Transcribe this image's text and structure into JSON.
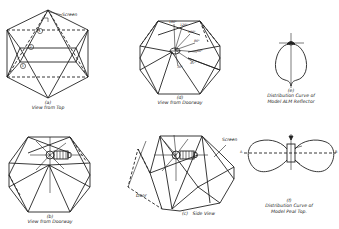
{
  "header": {
    "cropped_text_line": "(text line cut off at top edge)"
  },
  "figures": [
    {
      "id": "a",
      "label": "(a)",
      "caption": "View from Top",
      "annotation": "Screen",
      "markers": [
        "1",
        "2",
        "3"
      ]
    },
    {
      "id": "d",
      "label": "(d)",
      "caption": "View from Doorway",
      "ray_labels": [
        "180°",
        "120°",
        "100°",
        "80°",
        "60°",
        "45°",
        "30°"
      ]
    },
    {
      "id": "e",
      "label": "(e)",
      "caption_line1": "Distribution Curve of",
      "caption_line2": "Model ALM Reflector"
    },
    {
      "id": "b",
      "label": "(b)",
      "caption": "View from Doorway"
    },
    {
      "id": "c",
      "label": "(c)",
      "caption": "Side View",
      "annotation_screen": "Screen",
      "annotation_door": "Door"
    },
    {
      "id": "f",
      "label": "(f)",
      "caption_line1": "Distribution Curve of",
      "caption_line2": "Model Peal Top.",
      "axis_left": "A",
      "axis_right": "B"
    }
  ]
}
